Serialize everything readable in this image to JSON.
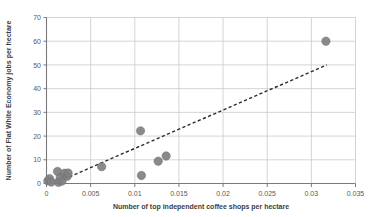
{
  "chart_data": {
    "type": "scatter",
    "title": "",
    "xlabel": "Number of top independent coffee shops per hectare",
    "ylabel": "Number of Flat White Economy jobs per hectare",
    "xlim": [
      0,
      0.035
    ],
    "ylim": [
      0,
      70
    ],
    "xticks": [
      0,
      0.005,
      0.01,
      0.015,
      0.02,
      0.025,
      0.03,
      0.035
    ],
    "xtick_labels": [
      "0",
      "0.005",
      "0.01",
      "0.015",
      "0.02",
      "0.025",
      "0.03",
      "0.035"
    ],
    "yticks": [
      0,
      10,
      20,
      30,
      40,
      50,
      60,
      70
    ],
    "ytick_labels": [
      "0",
      "10",
      "20",
      "30",
      "40",
      "50",
      "60",
      "70"
    ],
    "grid": "horizontal-and-vertical",
    "legend": "none",
    "marker_color": "#808083",
    "marker_shape": "circle",
    "marker_size_px": 4.2,
    "gridline_color": "#c9c9c9",
    "axis_color": "#7a7a7c",
    "background_color": "#ffffff",
    "series": [
      {
        "name": "Boroughs",
        "points": [
          {
            "x": 0.00015,
            "y": 1.1
          },
          {
            "x": 0.00035,
            "y": 2.0
          },
          {
            "x": 0.00055,
            "y": 0.6
          },
          {
            "x": 0.00125,
            "y": 5.1
          },
          {
            "x": 0.00135,
            "y": 0.5
          },
          {
            "x": 0.00155,
            "y": 2.4
          },
          {
            "x": 0.00175,
            "y": 1.0
          },
          {
            "x": 0.00205,
            "y": 4.3
          },
          {
            "x": 0.00235,
            "y": 3.0
          },
          {
            "x": 0.00245,
            "y": 4.4
          },
          {
            "x": 0.00625,
            "y": 7.1
          },
          {
            "x": 0.01065,
            "y": 22.2
          },
          {
            "x": 0.01075,
            "y": 3.4
          },
          {
            "x": 0.01265,
            "y": 9.4
          },
          {
            "x": 0.01355,
            "y": 11.6
          },
          {
            "x": 0.03165,
            "y": 60.0
          }
        ]
      }
    ],
    "trendline": {
      "style": "dashed",
      "color": "#2b2b2d",
      "x_start": 0.00085,
      "y_start": 0.0,
      "x_end": 0.03175,
      "y_end": 50.0
    }
  }
}
